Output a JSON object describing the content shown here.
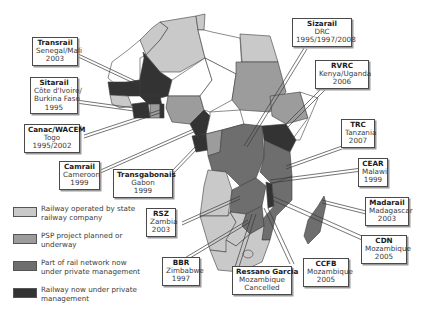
{
  "map": {
    "subject": "Railway concessions in Africa",
    "colors": {
      "state": "#c9c9c9",
      "psp_planned": "#9c9c9c",
      "part_private": "#6e6e6e",
      "private": "#333333",
      "ocean": "#ffffff",
      "non_rail": "#ffffff",
      "border": "#3c3c3c"
    }
  },
  "labels": [
    {
      "id": "transrail",
      "name": "Transrail",
      "lines": [
        "Senegal/Mali",
        "2003"
      ]
    },
    {
      "id": "sitarail",
      "name": "Sitarail",
      "lines": [
        "Côte d'Ivoire/",
        "Burkina Faso",
        "1995"
      ]
    },
    {
      "id": "canac",
      "name": "Canac/WACEM",
      "lines": [
        "Togo",
        "1995/2002"
      ]
    },
    {
      "id": "camrail",
      "name": "Camrail",
      "lines": [
        "Cameroon",
        "1999"
      ]
    },
    {
      "id": "transgabonais",
      "name": "Transgabonais",
      "lines": [
        "Gabon",
        "1999"
      ]
    },
    {
      "id": "rsz",
      "name": "RSZ",
      "lines": [
        "Zambia",
        "2003"
      ]
    },
    {
      "id": "bbr",
      "name": "BBR",
      "lines": [
        "Zimbabwe",
        "1997"
      ]
    },
    {
      "id": "ressano",
      "name": "Ressano Garcia",
      "lines": [
        "Mozambique",
        "Cancelled"
      ]
    },
    {
      "id": "ccfb",
      "name": "CCFB",
      "lines": [
        "Mozambique",
        "2005"
      ]
    },
    {
      "id": "cdn",
      "name": "CDN",
      "lines": [
        "Mozambique",
        "2005"
      ]
    },
    {
      "id": "madarail",
      "name": "Madarail",
      "lines": [
        "Madagascar",
        "2003"
      ]
    },
    {
      "id": "cear",
      "name": "CEAR",
      "lines": [
        "Malawi",
        "1999"
      ]
    },
    {
      "id": "trc",
      "name": "TRC",
      "lines": [
        "Tanzania",
        "2007"
      ]
    },
    {
      "id": "rvrc",
      "name": "RVRC",
      "lines": [
        "Kenya/Uganda",
        "2006"
      ]
    },
    {
      "id": "sizarail",
      "name": "Sizarail",
      "lines": [
        "DRC",
        "1995/1997/2008"
      ]
    }
  ],
  "legend": [
    {
      "key": "state",
      "text": "Railway operated by state railway company",
      "color": "#c9c9c9"
    },
    {
      "key": "psp_planned",
      "text": "PSP project planned or underway",
      "color": "#9c9c9c"
    },
    {
      "key": "part_private",
      "text": "Part of rail network now under private management",
      "color": "#6e6e6e"
    },
    {
      "key": "private",
      "text": "Railway now under private management",
      "color": "#333333"
    }
  ]
}
